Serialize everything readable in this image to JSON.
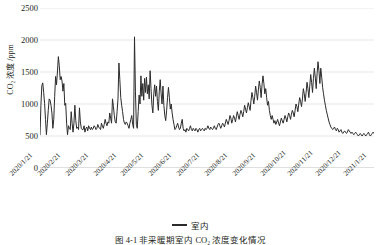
{
  "figure": {
    "caption": "图 4-1  非采暖期室内 CO₂ 浓度变化情况",
    "caption_note": "clipped at bottom edge of screenshot"
  },
  "legend": {
    "position": "bottom-center",
    "entries": [
      {
        "label": "室内",
        "marker": "line",
        "color": "#2b2b2b"
      }
    ]
  },
  "axes": {
    "y_title": "CO₂ 浓度 /ppm",
    "y_title_main": "浓度 /ppm",
    "y_ticks": [
      "0",
      "500",
      "1000",
      "1500",
      "2000",
      "2500"
    ],
    "x_ticks": [
      "2020/1/21",
      "2020/2/21",
      "2020/3/21",
      "2020/4/21",
      "2020/5/21",
      "2020/6/21",
      "2020/7/21",
      "2020/8/21",
      "2020/9/21",
      "2020/10/21",
      "2020/11/21",
      "2020/12/21",
      "2021/1/21"
    ]
  },
  "chart_data": {
    "type": "line",
    "title": "",
    "subtitle": "",
    "xlabel": "",
    "ylabel": "CO₂ 浓度 /ppm",
    "ylim": [
      0,
      2500
    ],
    "ytick_values": [
      0,
      500,
      1000,
      1500,
      2000,
      2500
    ],
    "grid": true,
    "grid_axis": "y",
    "legend_position": "bottom-center",
    "x_tick_labels": [
      "2020/1/21",
      "2020/2/21",
      "2020/3/21",
      "2020/4/21",
      "2020/5/21",
      "2020/6/21",
      "2020/7/21",
      "2020/8/21",
      "2020/9/21",
      "2020/10/21",
      "2020/11/21",
      "2020/12/21",
      "2021/1/21"
    ],
    "x_start": "2020/1/21",
    "x_end": "2021/1/21",
    "series": [
      {
        "name": "室内",
        "color": "#2b2b2b",
        "line_width": 1,
        "units": "ppm",
        "approx_min": 480,
        "approx_max": 2050,
        "values": [
          520,
          980,
          1290,
          1330,
          1180,
          1010,
          760,
          520,
          700,
          900,
          1080,
          1060,
          980,
          860,
          620,
          760,
          1120,
          1430,
          1300,
          1500,
          1740,
          1600,
          1380,
          1430,
          1360,
          1200,
          1320,
          980,
          1010,
          700,
          520,
          660,
          620,
          600,
          880,
          700,
          560,
          700,
          980,
          740,
          620,
          640,
          600,
          940,
          720,
          620,
          600,
          600,
          660,
          560,
          620,
          640,
          580,
          660,
          620,
          600,
          640,
          600,
          620,
          660,
          640,
          600,
          620,
          680,
          640,
          620,
          600,
          700,
          660,
          620,
          680,
          760,
          700,
          660,
          720,
          700,
          860,
          780,
          700,
          1080,
          960,
          820,
          720,
          700,
          880,
          1080,
          1640,
          1380,
          1100,
          980,
          880,
          760,
          700,
          680,
          720,
          700,
          660,
          620,
          700,
          760,
          820,
          680,
          620,
          2050,
          1200,
          680,
          620,
          880,
          1140,
          1000,
          1440,
          1120,
          1320,
          1060,
          1400,
          1180,
          1420,
          1160,
          1300,
          1080,
          1520,
          1240,
          980,
          860,
          1160,
          1300,
          1120,
          1280,
          1040,
          900,
          1200,
          1380,
          1160,
          1000,
          1280,
          980,
          820,
          740,
          900,
          1100,
          1260,
          1100,
          920,
          1000,
          860,
          760,
          680,
          600,
          620,
          660,
          700,
          640,
          600,
          620,
          700,
          760,
          620,
          580,
          600,
          560,
          620,
          600,
          580,
          620,
          660,
          600,
          580,
          620,
          600,
          580,
          620,
          600,
          560,
          600,
          620,
          580,
          600,
          620,
          600,
          580,
          620,
          600,
          620,
          660,
          620,
          600,
          640,
          620,
          600,
          620,
          660,
          620,
          600,
          640,
          680,
          700,
          660,
          620,
          660,
          700,
          680,
          640,
          700,
          760,
          720,
          680,
          740,
          820,
          780,
          700,
          760,
          820,
          780,
          720,
          800,
          880,
          820,
          760,
          840,
          900,
          860,
          800,
          880,
          980,
          920,
          860,
          940,
          1020,
          960,
          900,
          1060,
          1180,
          1100,
          1000,
          1120,
          1280,
          1180,
          1060,
          1220,
          1360,
          1260,
          1100,
          1300,
          1440,
          1320,
          1160,
          1240,
          1100,
          980,
          1040,
          900,
          820,
          760,
          820,
          760,
          700,
          740,
          680,
          720,
          760,
          700,
          660,
          720,
          780,
          740,
          700,
          760,
          820,
          780,
          720,
          800,
          860,
          820,
          760,
          840,
          900,
          860,
          800,
          900,
          1000,
          960,
          880,
          1000,
          1100,
          1040,
          960,
          1080,
          1240,
          1160,
          1040,
          1180,
          1340,
          1240,
          1100,
          1280,
          1460,
          1340,
          1180,
          1400,
          1560,
          1420,
          1240,
          1480,
          1660,
          1520,
          1320,
          1560,
          1420,
          1260,
          1160,
          1060,
          980,
          900,
          840,
          780,
          720,
          680,
          640,
          620,
          600,
          620,
          640,
          600,
          580,
          620,
          600,
          560,
          580,
          600,
          560,
          540,
          560,
          580,
          560,
          540,
          560,
          600,
          580,
          560,
          540,
          560,
          540,
          520,
          540,
          560,
          540,
          520,
          500,
          520,
          540,
          520,
          500,
          520,
          540,
          520,
          500,
          520,
          540,
          560,
          520,
          500,
          520,
          540,
          560,
          540
        ]
      }
    ]
  }
}
